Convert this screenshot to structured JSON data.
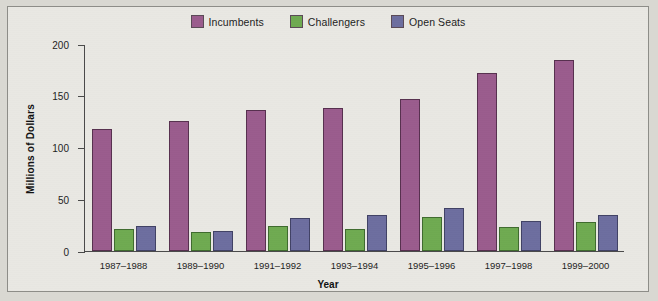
{
  "chart_data": {
    "type": "bar",
    "title": "",
    "xlabel": "Year",
    "ylabel": "Millions of Dollars",
    "ylim": [
      0,
      200
    ],
    "yticks": [
      0,
      50,
      100,
      150,
      200
    ],
    "grid": false,
    "legend_position": "top-center",
    "categories": [
      "1987–1988",
      "1989–1990",
      "1991–1992",
      "1993–1994",
      "1995–1996",
      "1997–1998",
      "1999–2000"
    ],
    "series": [
      {
        "name": "Incumbents",
        "color": "#9a5c8d",
        "values": [
          118,
          126,
          136,
          138,
          147,
          172,
          185
        ]
      },
      {
        "name": "Challengers",
        "color": "#6faa51",
        "values": [
          21,
          18,
          24,
          21,
          33,
          23,
          28
        ]
      },
      {
        "name": "Open Seats",
        "color": "#6d6e9f",
        "values": [
          24,
          19,
          32,
          35,
          42,
          29,
          35
        ]
      }
    ]
  },
  "legend": {
    "items": [
      {
        "label": "Incumbents",
        "color": "#9a5c8d"
      },
      {
        "label": "Challengers",
        "color": "#6faa51"
      },
      {
        "label": "Open Seats",
        "color": "#6d6e9f"
      }
    ]
  },
  "axes": {
    "y_label": "Millions of Dollars",
    "x_label": "Year",
    "y_tick_labels": [
      "200",
      "150",
      "100",
      "50",
      "0"
    ]
  }
}
